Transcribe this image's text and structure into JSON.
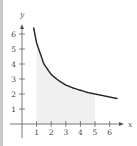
{
  "chart_data": {
    "type": "area",
    "title": "",
    "xlabel": "x",
    "ylabel": "y",
    "xlim": [
      0,
      6.8
    ],
    "ylim": [
      0,
      6.8
    ],
    "x_ticks": [
      "1",
      "2",
      "3",
      "4",
      "5",
      "6"
    ],
    "y_ticks": [
      "1",
      "2",
      "3",
      "4",
      "5",
      "6"
    ],
    "grid": false,
    "series": [
      {
        "name": "curve",
        "x": [
          0.8,
          1,
          1.5,
          2,
          2.5,
          3,
          3.5,
          4,
          4.5,
          5,
          5.5,
          6,
          6.5
        ],
        "y": [
          6.4,
          5.4,
          4.0,
          3.3,
          2.9,
          2.6,
          2.4,
          2.25,
          2.1,
          2.0,
          1.9,
          1.8,
          1.7
        ]
      }
    ],
    "shaded_region": {
      "x_from": 1,
      "x_to": 5,
      "color": "#f0f0f0"
    },
    "curve_color": "#222222"
  }
}
